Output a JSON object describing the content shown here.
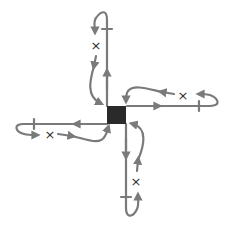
{
  "diagram": {
    "title": "",
    "colors": {
      "line": "#7a7a7a",
      "center": "#2a2a2a",
      "marker": "#333333",
      "background": "#ffffff"
    },
    "center_node": {
      "label": "",
      "shape": "filled-square"
    },
    "arms": [
      {
        "direction": "up",
        "outgoing_arrow": "up",
        "has_tick": true,
        "loop_marker": "×",
        "return_arrows": [
          "down",
          "down"
        ]
      },
      {
        "direction": "right",
        "outgoing_arrow": "right",
        "has_tick": true,
        "loop_marker": "×",
        "return_arrows": [
          "left",
          "left"
        ]
      },
      {
        "direction": "down",
        "outgoing_arrow": "down",
        "has_tick": true,
        "loop_marker": "×",
        "return_arrows": [
          "up",
          "up"
        ]
      },
      {
        "direction": "left",
        "outgoing_arrow": "left",
        "has_tick": true,
        "loop_marker": "×",
        "return_arrows": [
          "right",
          "right"
        ]
      }
    ]
  }
}
